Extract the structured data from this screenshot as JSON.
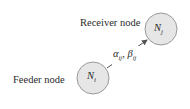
{
  "diagram": {
    "receiver": {
      "label": "Receiver node",
      "symbol": "N",
      "subscript": "j",
      "center": [
        161,
        29
      ],
      "radius": 16
    },
    "feeder": {
      "label": "Feeder node",
      "symbol": "N",
      "subscript": "i",
      "center": [
        93,
        78
      ],
      "radius": 16
    },
    "edge": {
      "alpha": "α",
      "beta": "β",
      "subscript": "ij",
      "separator": ", ",
      "direction": "feeder-to-receiver"
    },
    "colors": {
      "node_fill": "#e6e6e6",
      "node_stroke": "#9a9a9a",
      "arrow": "#555555",
      "text": "#2a2a2a"
    }
  }
}
